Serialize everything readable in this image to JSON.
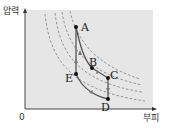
{
  "axes": {
    "y_label": "압력",
    "x_label": "부피",
    "origin_label": "0"
  },
  "points": {
    "A": "A",
    "B": "B",
    "C": "C",
    "D": "D",
    "E": "E"
  },
  "colors": {
    "background": "#e6e6e6",
    "isotherm": "#888888",
    "path": "#555555",
    "point": "#111111"
  },
  "process_path": [
    "A",
    "B",
    "C",
    "D",
    "E",
    "A"
  ]
}
